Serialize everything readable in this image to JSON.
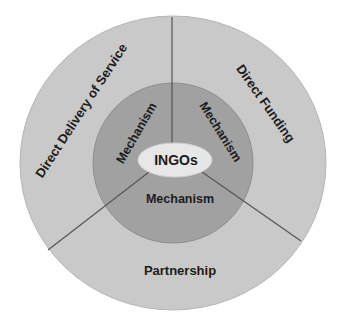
{
  "diagram": {
    "title": "",
    "colors": {
      "background": "#ffffff",
      "outer_ring": "#c9c9c9",
      "middle_ring": "#a1a1a1",
      "core": "#e7e7e7",
      "divider": "#555555",
      "text": "#1c1c1c"
    },
    "core": {
      "label": "INGOs"
    },
    "middle_ring": {
      "segments": [
        {
          "id": "left",
          "label": "Mechanism"
        },
        {
          "id": "right",
          "label": "Mechanism"
        },
        {
          "id": "bottom",
          "label": "Mechanism"
        }
      ]
    },
    "outer_ring": {
      "segments": [
        {
          "id": "left",
          "label": "Direct Delivery of Service"
        },
        {
          "id": "right",
          "label": "Direct Funding"
        },
        {
          "id": "bottom",
          "label": "Partnership"
        }
      ]
    }
  }
}
